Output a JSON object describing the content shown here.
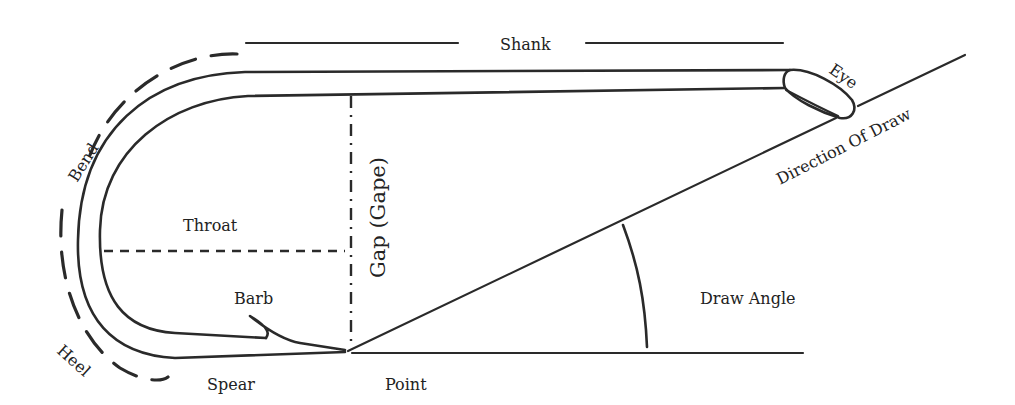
{
  "diagram": {
    "labels": {
      "shank": "Shank",
      "eye": "Eye",
      "direction_of_draw": "Direction Of Draw",
      "bend": "Bend",
      "throat": "Throat",
      "gap": "Gap (Gape)",
      "barb": "Barb",
      "draw_angle": "Draw Angle",
      "heel": "Heel",
      "spear": "Spear",
      "point": "Point"
    },
    "colors": {
      "ink": "#2a2a2a",
      "background": "#ffffff"
    }
  }
}
